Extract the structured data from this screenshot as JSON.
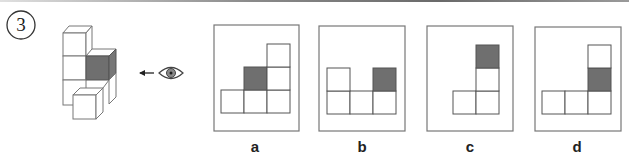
{
  "question": {
    "number": "3",
    "viewer_icon": "eye-icon",
    "arrow_icon": "arrow-left-icon",
    "shaded_color": "#6f6f6f",
    "line_color": "#555555"
  },
  "options": [
    {
      "label": "a",
      "cells": [
        [
          0,
          0
        ],
        [
          1,
          0
        ],
        [
          2,
          0
        ],
        [
          1,
          1
        ],
        [
          2,
          1
        ],
        [
          2,
          2
        ]
      ],
      "shaded": [
        1,
        1
      ]
    },
    {
      "label": "b",
      "cells": [
        [
          0,
          0
        ],
        [
          1,
          0
        ],
        [
          2,
          0
        ],
        [
          0,
          1
        ],
        [
          2,
          1
        ]
      ],
      "shaded": [
        2,
        1
      ]
    },
    {
      "label": "c",
      "cells": [
        [
          0,
          0
        ],
        [
          1,
          0
        ],
        [
          1,
          1
        ],
        [
          1,
          2
        ]
      ],
      "shaded": [
        1,
        2
      ]
    },
    {
      "label": "d",
      "cells": [
        [
          0,
          0
        ],
        [
          1,
          0
        ],
        [
          2,
          0
        ],
        [
          2,
          1
        ],
        [
          2,
          2
        ]
      ],
      "shaded": [
        2,
        1
      ]
    }
  ]
}
